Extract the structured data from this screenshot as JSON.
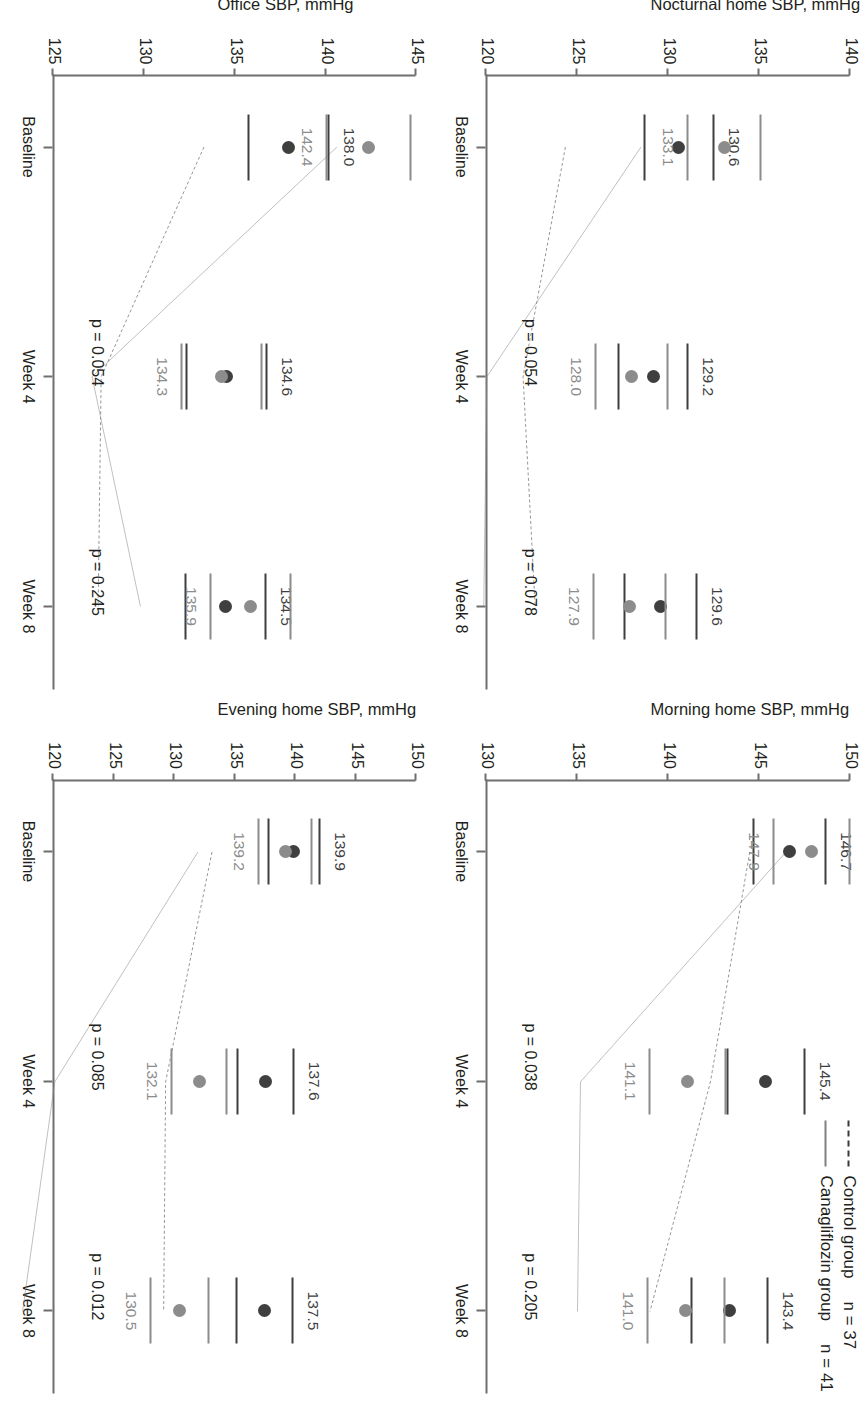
{
  "legend": {
    "control": {
      "label": "Control group",
      "n": "n = 37",
      "style": "dashed",
      "color": "#3f3f3f"
    },
    "canagliflozin": {
      "label": "Canagliflozin group",
      "n": "n = 41",
      "style": "solid",
      "color": "#8c8c8c"
    }
  },
  "x_categories": [
    "Baseline",
    "Week 4",
    "Week 8"
  ],
  "chart_data": [
    {
      "type": "line",
      "panel": "nocturnal",
      "title": "",
      "ylabel": "Nocturnal home SBP, mmHg",
      "xlabel": "",
      "categories": [
        "Baseline",
        "Week 4",
        "Week 8"
      ],
      "ylim": [
        120,
        140
      ],
      "yticks": [
        140,
        135,
        130,
        125,
        120
      ],
      "grid": false,
      "legend_position": "top-right",
      "series": [
        {
          "name": "Control group",
          "style": "dashed",
          "color": "#3f3f3f",
          "values": [
            130.6,
            129.2,
            129.6
          ],
          "labels": [
            "130.6",
            "129.2",
            "129.6"
          ],
          "errors": [
            1.9,
            1.9,
            2.0
          ]
        },
        {
          "name": "Canagliflozin group",
          "style": "solid",
          "color": "#8c8c8c",
          "values": [
            133.1,
            128.0,
            127.9
          ],
          "labels": [
            "133.1",
            "128.0",
            "127.9"
          ],
          "errors": [
            2.0,
            2.0,
            2.0
          ]
        }
      ],
      "annotations": [
        {
          "text": "p = 0.054",
          "at": "Week 4"
        },
        {
          "text": "p = 0.078",
          "at": "Week 8"
        }
      ]
    },
    {
      "type": "line",
      "panel": "morning",
      "title": "",
      "ylabel": "Morning home SBP, mmHg",
      "xlabel": "",
      "categories": [
        "Baseline",
        "Week 4",
        "Week 8"
      ],
      "ylim": [
        130,
        150
      ],
      "yticks": [
        150,
        145,
        140,
        135,
        130
      ],
      "grid": false,
      "legend_position": "top-right",
      "series": [
        {
          "name": "Control group",
          "style": "dashed",
          "color": "#3f3f3f",
          "values": [
            146.7,
            145.4,
            143.4
          ],
          "labels": [
            "146.7",
            "145.4",
            "143.4"
          ],
          "errors": [
            2.0,
            2.1,
            2.1
          ]
        },
        {
          "name": "Canagliflozin group",
          "style": "solid",
          "color": "#8c8c8c",
          "values": [
            147.9,
            141.1,
            141.0
          ],
          "labels": [
            "147.9",
            "141.1",
            "141.0"
          ],
          "errors": [
            2.1,
            2.1,
            2.1
          ]
        }
      ],
      "annotations": [
        {
          "text": "p = 0.038",
          "at": "Week 4"
        },
        {
          "text": "p = 0.205",
          "at": "Week 8"
        }
      ]
    },
    {
      "type": "line",
      "panel": "office",
      "title": "",
      "ylabel": "Office SBP, mmHg",
      "xlabel": "",
      "categories": [
        "Baseline",
        "Week 4",
        "Week 8"
      ],
      "ylim": [
        125,
        145
      ],
      "yticks": [
        145,
        140,
        135,
        130,
        125
      ],
      "grid": false,
      "legend_position": "top-right",
      "series": [
        {
          "name": "Control group",
          "style": "dashed",
          "color": "#3f3f3f",
          "values": [
            138.0,
            134.6,
            134.5
          ],
          "labels": [
            "138.0",
            "134.6",
            "134.5"
          ],
          "errors": [
            2.2,
            2.2,
            2.2
          ]
        },
        {
          "name": "Canagliflozin group",
          "style": "solid",
          "color": "#8c8c8c",
          "values": [
            142.4,
            134.3,
            135.9
          ],
          "labels": [
            "142.4",
            "134.3",
            "135.9"
          ],
          "errors": [
            2.3,
            2.2,
            2.2
          ]
        }
      ],
      "annotations": [
        {
          "text": "p = 0.054",
          "at": "Week 4"
        },
        {
          "text": "p = 0.245",
          "at": "Week 8"
        }
      ]
    },
    {
      "type": "line",
      "panel": "evening",
      "title": "",
      "ylabel": "Evening home SBP, mmHg",
      "xlabel": "",
      "categories": [
        "Baseline",
        "Week 4",
        "Week 8"
      ],
      "ylim": [
        120,
        150
      ],
      "yticks": [
        150,
        145,
        140,
        135,
        130,
        125,
        120
      ],
      "grid": false,
      "legend_position": "top-right",
      "series": [
        {
          "name": "Control group",
          "style": "dashed",
          "color": "#3f3f3f",
          "values": [
            139.9,
            137.6,
            137.5
          ],
          "labels": [
            "139.9",
            "137.6",
            "137.5"
          ],
          "errors": [
            2.1,
            2.3,
            2.3
          ]
        },
        {
          "name": "Canagliflozin group",
          "style": "solid",
          "color": "#8c8c8c",
          "values": [
            139.2,
            132.1,
            130.5
          ],
          "labels": [
            "139.2",
            "132.1",
            "130.5"
          ],
          "errors": [
            2.2,
            2.3,
            2.4
          ]
        }
      ],
      "annotations": [
        {
          "text": "p = 0.085",
          "at": "Week 4"
        },
        {
          "text": "p = 0.012",
          "at": "Week 8"
        }
      ]
    }
  ]
}
